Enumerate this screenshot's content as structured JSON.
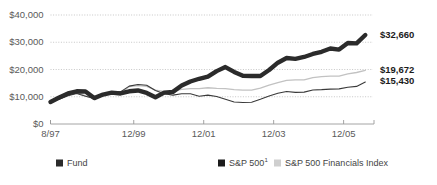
{
  "chart_data": {
    "type": "line",
    "title": "",
    "subtitle": "",
    "xlabel": "",
    "ylabel": "",
    "grid": true,
    "legend_position": "bottom",
    "ylim": [
      0,
      40000
    ],
    "ytick_labels": [
      "$40,000",
      "$30,000",
      "$20,000",
      "$10,000",
      "$0"
    ],
    "ytick_values": [
      40000,
      30000,
      20000,
      10000,
      0
    ],
    "xtick_labels": [
      "8/97",
      "12/99",
      "12/01",
      "12/03",
      "12/05"
    ],
    "xtick_values": [
      1997.58,
      1999.96,
      2001.96,
      2003.96,
      2005.96
    ],
    "xlim": [
      1997.58,
      2006.8
    ],
    "end_labels": [
      {
        "text": "$32,660",
        "value": 32660,
        "series": "Fund"
      },
      {
        "text": "$19,672",
        "value": 19672,
        "series": "S&P 500 Financials Index"
      },
      {
        "text": "$15,430",
        "value": 15430,
        "series": "S&P 500"
      }
    ],
    "series": [
      {
        "name": "Fund",
        "legend_label": "Fund",
        "color": "#2b2b2b",
        "width": "thick",
        "final_value": 32660,
        "x": [
          1997.58,
          1997.83,
          1998.08,
          1998.33,
          1998.58,
          1998.83,
          1999.08,
          1999.33,
          1999.58,
          1999.83,
          2000.08,
          2000.33,
          2000.58,
          2000.83,
          2001.08,
          2001.33,
          2001.58,
          2001.83,
          2002.08,
          2002.33,
          2002.58,
          2002.83,
          2003.08,
          2003.33,
          2003.58,
          2003.83,
          2004.08,
          2004.33,
          2004.58,
          2004.83,
          2005.08,
          2005.33,
          2005.58,
          2005.83,
          2006.08,
          2006.33,
          2006.58
        ],
        "values": [
          8100,
          9700,
          11200,
          12000,
          11900,
          9500,
          10800,
          11500,
          11200,
          12000,
          12300,
          11400,
          9800,
          11500,
          11800,
          14100,
          15600,
          16600,
          17400,
          19400,
          20900,
          19100,
          17700,
          17600,
          17600,
          19800,
          22500,
          24200,
          23900,
          24600,
          25700,
          26500,
          27700,
          27300,
          29700,
          29600,
          32660
        ]
      },
      {
        "name": "S&P 500 Financials Index",
        "legend_label": "S&P 500 Financials Index",
        "color": "#c2c2c2",
        "width": "thin",
        "final_value": 19672,
        "x": [
          1997.58,
          1997.83,
          1998.08,
          1998.33,
          1998.58,
          1998.83,
          1999.08,
          1999.33,
          1999.58,
          1999.83,
          2000.08,
          2000.33,
          2000.58,
          2000.83,
          2001.08,
          2001.33,
          2001.58,
          2001.83,
          2002.08,
          2002.33,
          2002.58,
          2002.83,
          2003.08,
          2003.33,
          2003.58,
          2003.83,
          2004.08,
          2004.33,
          2004.58,
          2004.83,
          2005.08,
          2005.33,
          2005.58,
          2005.83,
          2006.08,
          2006.33,
          2006.58
        ],
        "values": [
          8500,
          9600,
          10900,
          11400,
          10400,
          9200,
          10500,
          11500,
          11300,
          13700,
          14100,
          13800,
          12400,
          12000,
          12100,
          12700,
          13000,
          13000,
          13300,
          13100,
          13000,
          12600,
          12400,
          12400,
          13200,
          14300,
          15200,
          16000,
          16200,
          16200,
          17000,
          17400,
          17600,
          17600,
          18400,
          18900,
          19672
        ]
      },
      {
        "name": "S&P 500",
        "legend_label": "S&P 500",
        "legend_superscript": "1",
        "color": "#3a3a3a",
        "width": "thin",
        "final_value": 15430,
        "x": [
          1997.58,
          1997.83,
          1998.08,
          1998.33,
          1998.58,
          1998.83,
          1999.08,
          1999.33,
          1999.58,
          1999.83,
          2000.08,
          2000.33,
          2000.58,
          2000.83,
          2001.08,
          2001.33,
          2001.58,
          2001.83,
          2002.08,
          2002.33,
          2002.58,
          2002.83,
          2003.08,
          2003.33,
          2003.58,
          2003.83,
          2004.08,
          2004.33,
          2004.58,
          2004.83,
          2005.08,
          2005.33,
          2005.58,
          2005.83,
          2006.08,
          2006.33,
          2006.58
        ],
        "values": [
          8400,
          9100,
          10400,
          11200,
          10200,
          9400,
          10700,
          11800,
          11800,
          13900,
          14500,
          14200,
          12300,
          11100,
          10600,
          11100,
          11100,
          10200,
          10600,
          10100,
          9100,
          8100,
          7900,
          8000,
          9100,
          10300,
          11300,
          11900,
          11600,
          11700,
          12500,
          12600,
          12800,
          12900,
          13500,
          13800,
          15430
        ]
      }
    ]
  },
  "legend": {
    "items": [
      {
        "label": "Fund",
        "marker": "square-dark",
        "color": "#2b2b2b"
      },
      {
        "label": "S&P 500",
        "superscript": "1",
        "marker": "square-dark",
        "color": "#1b1b1b"
      },
      {
        "label": "S&P 500 Financials Index",
        "marker": "square-light",
        "color": "#cfcfcf"
      }
    ]
  },
  "colors": {
    "fund": "#2b2b2b",
    "sp500": "#3a3a3a",
    "financials": "#c2c2c2",
    "grid": "#b9b9b9",
    "axis": "#9a9a9a",
    "tick_text": "#5a5a5a",
    "end_label_text": "#1b1b1b",
    "background": "#ffffff"
  }
}
